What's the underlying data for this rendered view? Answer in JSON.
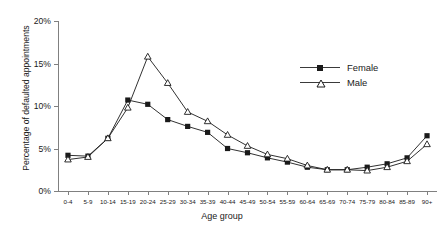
{
  "chart_data": {
    "type": "line",
    "title": "",
    "xlabel": "Age group",
    "ylabel": "Percentage of defaulted appointments",
    "categories": [
      "0-4",
      "5-9",
      "10-14",
      "15-19",
      "20-24",
      "25-29",
      "30-34",
      "35-39",
      "40-44",
      "45-49",
      "50-54",
      "55-59",
      "60-64",
      "65-69",
      "70-74",
      "75-79",
      "80-84",
      "85-89",
      "90+"
    ],
    "ylim": [
      0,
      20
    ],
    "yticks": [
      "0%",
      "5%",
      "10%",
      "15%",
      "20%"
    ],
    "ytick_values": [
      0,
      5,
      10,
      15,
      20
    ],
    "grid": false,
    "legend_position": "upper right",
    "series": [
      {
        "name": "Female",
        "marker": "filled-square",
        "color": "#1a1a1a",
        "values": [
          4.2,
          4.1,
          6.2,
          10.7,
          10.2,
          8.4,
          7.6,
          6.9,
          5.0,
          4.5,
          3.9,
          3.4,
          2.8,
          2.5,
          2.5,
          2.8,
          3.2,
          3.9,
          6.5
        ]
      },
      {
        "name": "Male",
        "marker": "open-triangle",
        "color": "#1a1a1a",
        "values": [
          3.7,
          4.0,
          6.2,
          9.8,
          15.8,
          12.7,
          9.3,
          8.2,
          6.6,
          5.3,
          4.3,
          3.8,
          3.0,
          2.5,
          2.5,
          2.4,
          2.8,
          3.5,
          5.5
        ]
      }
    ]
  },
  "legend": {
    "items": [
      {
        "label": "Female"
      },
      {
        "label": "Male"
      }
    ]
  }
}
